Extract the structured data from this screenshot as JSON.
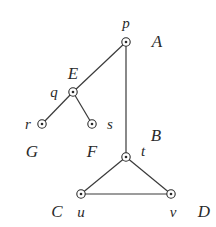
{
  "diagram": {
    "type": "tree-graph",
    "nodes": [
      {
        "id": "p",
        "x": 126,
        "y": 42,
        "label": "p",
        "lx": 126,
        "ly": 28,
        "name": "A",
        "nx": 157,
        "ny": 47
      },
      {
        "id": "q",
        "x": 73,
        "y": 92,
        "label": "q",
        "lx": 54,
        "ly": 97,
        "name": "E",
        "nx": 73,
        "ny": 79
      },
      {
        "id": "r",
        "x": 42,
        "y": 124,
        "label": "r",
        "lx": 28,
        "ly": 129,
        "name": "G",
        "nx": 32,
        "ny": 157
      },
      {
        "id": "s",
        "x": 92,
        "y": 124,
        "label": "s",
        "lx": 110,
        "ly": 129,
        "name": "F",
        "nx": 92,
        "ny": 157
      },
      {
        "id": "t",
        "x": 126,
        "y": 157,
        "label": "t",
        "lx": 143,
        "ly": 156,
        "name": "B",
        "nx": 156,
        "ny": 141
      },
      {
        "id": "u",
        "x": 81,
        "y": 194,
        "label": "u",
        "lx": 81,
        "ly": 217,
        "name": "C",
        "nx": 57,
        "ny": 217
      },
      {
        "id": "v",
        "x": 171,
        "y": 194,
        "label": "v",
        "lx": 173,
        "ly": 217,
        "name": "D",
        "nx": 204,
        "ny": 217
      }
    ],
    "edges": [
      {
        "from": "p",
        "to": "q"
      },
      {
        "from": "p",
        "to": "t"
      },
      {
        "from": "q",
        "to": "r"
      },
      {
        "from": "q",
        "to": "s"
      },
      {
        "from": "t",
        "to": "u"
      },
      {
        "from": "t",
        "to": "v"
      },
      {
        "from": "u",
        "to": "v"
      }
    ]
  }
}
